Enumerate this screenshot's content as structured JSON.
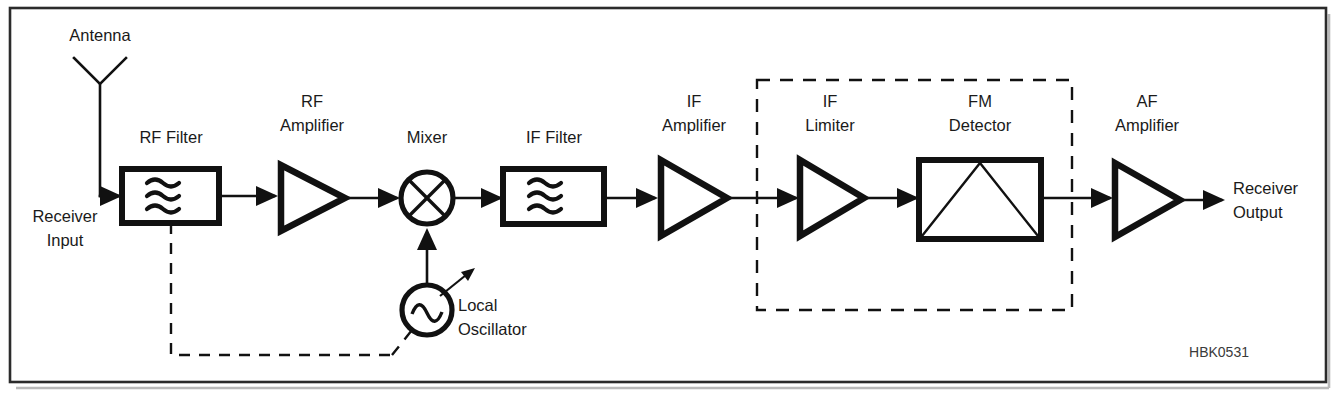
{
  "figure": {
    "figure_code": "HBK0531",
    "background_color": "#ffffff",
    "line_color": "#111111",
    "frame_color": "#2b2b2b"
  },
  "labels": {
    "antenna": "Antenna",
    "receiver_input_line1": "Receiver",
    "receiver_input_line2": "Input",
    "rf_filter": "RF Filter",
    "rf_amplifier_line1": "RF",
    "rf_amplifier_line2": "Amplifier",
    "mixer": "Mixer",
    "if_filter": "IF Filter",
    "local_oscillator_line1": "Local",
    "local_oscillator_line2": "Oscillator",
    "if_amplifier_line1": "IF",
    "if_amplifier_line2": "Amplifier",
    "if_limiter_line1": "IF",
    "if_limiter_line2": "Limiter",
    "fm_detector_line1": "FM",
    "fm_detector_line2": "Detector",
    "af_amplifier_line1": "AF",
    "af_amplifier_line2": "Amplifier",
    "receiver_output_line1": "Receiver",
    "receiver_output_line2": "Output"
  },
  "blocks": [
    {
      "id": "antenna",
      "name": "antenna-symbol",
      "label": "Antenna",
      "shape": "dipole-v"
    },
    {
      "id": "rf-filter",
      "name": "rf-filter-block",
      "label": "RF Filter",
      "shape": "rectangle-with-wave-symbol"
    },
    {
      "id": "rf-amplifier",
      "name": "rf-amplifier-block",
      "label": "RF Amplifier",
      "shape": "triangle"
    },
    {
      "id": "mixer",
      "name": "mixer-block",
      "label": "Mixer",
      "shape": "circle-with-x"
    },
    {
      "id": "local-oscillator",
      "name": "local-oscillator-block",
      "label": "Local Oscillator",
      "shape": "circle-with-sine-and-tuning-arrow"
    },
    {
      "id": "if-filter",
      "name": "if-filter-block",
      "label": "IF Filter",
      "shape": "rectangle-with-wave-symbol"
    },
    {
      "id": "if-amplifier",
      "name": "if-amplifier-block",
      "label": "IF Amplifier",
      "shape": "triangle"
    },
    {
      "id": "if-limiter",
      "name": "if-limiter-block",
      "label": "IF Limiter",
      "shape": "triangle"
    },
    {
      "id": "fm-detector",
      "name": "fm-detector-block",
      "label": "FM Detector",
      "shape": "rectangle-with-triangle"
    },
    {
      "id": "af-amplifier",
      "name": "af-amplifier-block",
      "label": "AF Amplifier",
      "shape": "triangle"
    }
  ],
  "signal_flow": [
    "Antenna / Receiver Input",
    "RF Filter",
    "RF Amplifier",
    "Mixer",
    "IF Filter",
    "IF Amplifier",
    "IF Limiter",
    "FM Detector",
    "AF Amplifier",
    "Receiver Output"
  ],
  "annotations": {
    "dashed_group_note": "IF Limiter and FM Detector enclosed by dashed box",
    "dashed_tuning_link": "Dashed ganged-tuning link from RF Filter to Local Oscillator",
    "local_oscillator_injection": "Local Oscillator feeds Mixer from below"
  }
}
